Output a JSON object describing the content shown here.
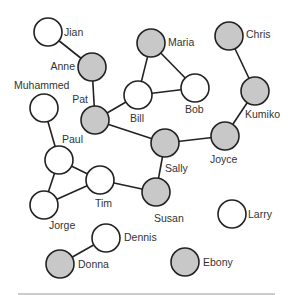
{
  "diagram": {
    "type": "social-network-graph",
    "colors": {
      "shaded": "#c8c8c8",
      "unshaded": "#ffffff",
      "stroke": "#222222",
      "text": "#333333"
    },
    "node_radius": 14,
    "nodes": [
      {
        "id": "jian",
        "label": "Jian",
        "x": 48,
        "y": 32,
        "shaded": false,
        "lx": 64,
        "ly": 36,
        "anchor": "start"
      },
      {
        "id": "anne",
        "label": "Anne",
        "x": 92,
        "y": 67,
        "shaded": true,
        "lx": 75,
        "ly": 70,
        "anchor": "end"
      },
      {
        "id": "muhammed",
        "label": "Muhammed",
        "x": 44,
        "y": 108,
        "shaded": false,
        "lx": 14,
        "ly": 89,
        "anchor": "start"
      },
      {
        "id": "pat",
        "label": "Pat",
        "x": 95,
        "y": 120,
        "shaded": true,
        "lx": 88,
        "ly": 103,
        "anchor": "end"
      },
      {
        "id": "maria",
        "label": "Maria",
        "x": 151,
        "y": 43,
        "shaded": true,
        "lx": 168,
        "ly": 46,
        "anchor": "start"
      },
      {
        "id": "bill",
        "label": "Bill",
        "x": 138,
        "y": 95,
        "shaded": false,
        "lx": 130,
        "ly": 122,
        "anchor": "start"
      },
      {
        "id": "bob",
        "label": "Bob",
        "x": 195,
        "y": 88,
        "shaded": false,
        "lx": 185,
        "ly": 113,
        "anchor": "start"
      },
      {
        "id": "chris",
        "label": "Chris",
        "x": 229,
        "y": 36,
        "shaded": true,
        "lx": 246,
        "ly": 38,
        "anchor": "start"
      },
      {
        "id": "kumiko",
        "label": "Kumiko",
        "x": 255,
        "y": 91,
        "shaded": true,
        "lx": 245,
        "ly": 118,
        "anchor": "start"
      },
      {
        "id": "joyce",
        "label": "Joyce",
        "x": 225,
        "y": 136,
        "shaded": true,
        "lx": 210,
        "ly": 163,
        "anchor": "start"
      },
      {
        "id": "sally",
        "label": "Sally",
        "x": 165,
        "y": 143,
        "shaded": true,
        "lx": 165,
        "ly": 172,
        "anchor": "start"
      },
      {
        "id": "paul",
        "label": "Paul",
        "x": 59,
        "y": 160,
        "shaded": false,
        "lx": 62,
        "ly": 143,
        "anchor": "start"
      },
      {
        "id": "tim",
        "label": "Tim",
        "x": 100,
        "y": 180,
        "shaded": false,
        "lx": 95,
        "ly": 207,
        "anchor": "start"
      },
      {
        "id": "susan",
        "label": "Susan",
        "x": 156,
        "y": 192,
        "shaded": true,
        "lx": 154,
        "ly": 222,
        "anchor": "start"
      },
      {
        "id": "jorge",
        "label": "Jorge",
        "x": 44,
        "y": 205,
        "shaded": false,
        "lx": 49,
        "ly": 229,
        "anchor": "start"
      },
      {
        "id": "dennis",
        "label": "Dennis",
        "x": 106,
        "y": 238,
        "shaded": false,
        "lx": 124,
        "ly": 241,
        "anchor": "start"
      },
      {
        "id": "larry",
        "label": "Larry",
        "x": 232,
        "y": 214,
        "shaded": false,
        "lx": 248,
        "ly": 218,
        "anchor": "start"
      },
      {
        "id": "donna",
        "label": "Donna",
        "x": 60,
        "y": 264,
        "shaded": true,
        "lx": 78,
        "ly": 268,
        "anchor": "start"
      },
      {
        "id": "ebony",
        "label": "Ebony",
        "x": 185,
        "y": 262,
        "shaded": true,
        "lx": 203,
        "ly": 266,
        "anchor": "start"
      }
    ],
    "edges": [
      [
        "jian",
        "anne"
      ],
      [
        "anne",
        "pat"
      ],
      [
        "pat",
        "bill"
      ],
      [
        "pat",
        "sally"
      ],
      [
        "bill",
        "maria"
      ],
      [
        "bill",
        "bob"
      ],
      [
        "maria",
        "bob"
      ],
      [
        "chris",
        "kumiko"
      ],
      [
        "kumiko",
        "joyce"
      ],
      [
        "joyce",
        "sally"
      ],
      [
        "sally",
        "susan"
      ],
      [
        "susan",
        "tim"
      ],
      [
        "muhammed",
        "paul"
      ],
      [
        "paul",
        "tim"
      ],
      [
        "paul",
        "jorge"
      ],
      [
        "jorge",
        "tim"
      ],
      [
        "dennis",
        "donna"
      ]
    ],
    "rule": {
      "x1": 18,
      "x2": 275,
      "y": 294
    }
  }
}
